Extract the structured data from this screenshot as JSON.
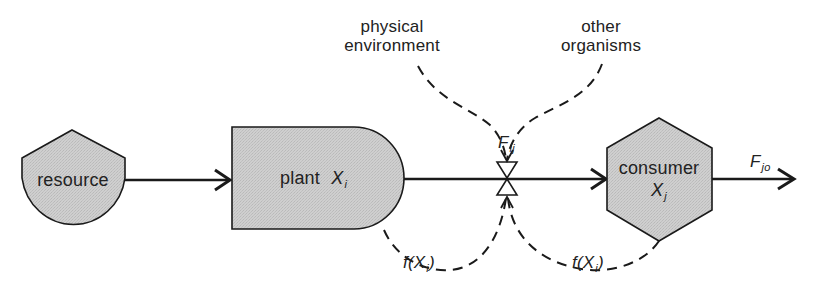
{
  "diagram": {
    "type": "flow",
    "nodes": {
      "resource": {
        "label": "resource",
        "shape": "shield"
      },
      "plant": {
        "label": "plant",
        "var": "X",
        "var_sub": "i",
        "shape": "rounded-right-box"
      },
      "consumer": {
        "label": "consumer",
        "var": "X",
        "var_sub": "j",
        "shape": "hexagon"
      },
      "valve": {
        "shape": "bowtie-valve"
      }
    },
    "influences": {
      "physical_environment": {
        "line1": "physical",
        "line2": "environment"
      },
      "other_organisms": {
        "line1": "other",
        "line2": "organisms"
      }
    },
    "flows": {
      "flow_ij": {
        "symbol": "F",
        "sub": "ij"
      },
      "flow_jo": {
        "symbol": "F",
        "sub": "jo"
      }
    },
    "feedback": {
      "from_plant": {
        "func": "f(",
        "var": "X",
        "sub": "i",
        "close": ")"
      },
      "from_consumer": {
        "func": "f(",
        "var": "X",
        "sub": "i",
        "close": ")"
      }
    },
    "colors": {
      "node_fill": "#c8c8c8",
      "stroke": "#1a1a1a",
      "background": "#ffffff"
    }
  }
}
